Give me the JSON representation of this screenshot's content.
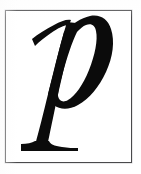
{
  "image": {
    "kind": "glyph-specimen",
    "width": 141,
    "height": 174,
    "page_background": "#ffffff",
    "alt_text": "p"
  },
  "plate": {
    "frame_color": "#4a4a4c",
    "frame_border_width_px": 1,
    "frame_x": 5,
    "frame_y": 10,
    "frame_width": 127,
    "frame_height": 153,
    "interior_background": "#ffffff"
  },
  "glyph": {
    "character": "p",
    "name": "latin-small-letter-p",
    "style": "italic",
    "serif": true,
    "weight": "regular",
    "ink_color": "#0b0b0b",
    "features": [
      "calligraphic entry stroke",
      "slanted oval bowl counter",
      "flat foot serif on descender"
    ],
    "bounds": {
      "left_px": 33,
      "top_px": 27,
      "right_px": 113,
      "bottom_px": 151
    }
  },
  "labels": {
    "page_title": "",
    "caption": ""
  }
}
